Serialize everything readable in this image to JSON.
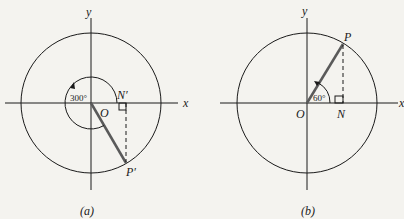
{
  "figures": [
    {
      "id": "a",
      "caption": "(a)",
      "axis_x_label": "x",
      "axis_y_label": "y",
      "origin_label": "O",
      "point_label": "P′",
      "foot_label": "N′",
      "angle_label": "300°",
      "angle_degrees": 300
    },
    {
      "id": "b",
      "caption": "(b)",
      "axis_x_label": "x",
      "axis_y_label": "y",
      "origin_label": "O",
      "point_label": "P",
      "foot_label": "N",
      "angle_label": "60°",
      "angle_degrees": 60
    }
  ],
  "colors": {
    "line": "#1a1a1a",
    "radius": "#5a5a5a",
    "background": "#f4f3ef"
  }
}
